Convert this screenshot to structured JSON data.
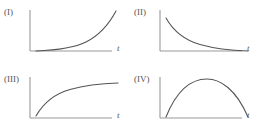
{
  "figure": {
    "title": "",
    "background_color": "#ffffff",
    "axis_color": "#999999",
    "curve_color": "#555555",
    "width": 261,
    "height": 134
  },
  "panels": [
    {
      "label": "(I)",
      "xlabel": "t",
      "ylabel": "",
      "curve_name": "exponential-growth-curve",
      "description": "exponential growth",
      "path": "M 6 43 C 26 42.2, 44 40, 56 34 C 68 28, 78 18, 86 3"
    },
    {
      "label": "(II)",
      "xlabel": "t",
      "ylabel": "",
      "curve_name": "exponential-decay-curve",
      "description": "exponential decay to positive asymptote",
      "path": "M 6 10 C 14 24, 24 32, 40 36.5 C 56 41, 72 42.5, 88 43"
    },
    {
      "label": "(III)",
      "xlabel": "t",
      "ylabel": "",
      "curve_name": "saturating-growth-curve",
      "description": "saturating growth to plateau",
      "path": "M 6 41 C 14 27, 24 19, 40 14.5 C 56 10, 72 8.5, 88 8"
    },
    {
      "label": "(IV)",
      "xlabel": "t",
      "ylabel": "",
      "curve_name": "inverted-parabola-curve",
      "description": "rise to maximum then fall",
      "path": "M 6 42 C 18 12, 34 4, 47 4 C 60 4, 76 14, 88 42"
    }
  ],
  "chart_data": {
    "type": "line",
    "title": "",
    "xlabel": "t",
    "ylabel": "",
    "grid": false,
    "legend": "none",
    "panel_layout": "2x2",
    "xlim": [
      0,
      1
    ],
    "ylim": [
      0,
      1
    ],
    "series": [
      {
        "name": "(I)",
        "shape": "exponential growth",
        "x": [
          0.0,
          0.2,
          0.4,
          0.6,
          0.8,
          1.0
        ],
        "values": [
          0.1,
          0.13,
          0.2,
          0.33,
          0.58,
          1.0
        ]
      },
      {
        "name": "(II)",
        "shape": "exponential decay to positive asymptote",
        "x": [
          0.0,
          0.2,
          0.4,
          0.6,
          0.8,
          1.0
        ],
        "values": [
          0.85,
          0.5,
          0.31,
          0.21,
          0.15,
          0.12
        ]
      },
      {
        "name": "(III)",
        "shape": "saturating growth to plateau",
        "x": [
          0.0,
          0.2,
          0.4,
          0.6,
          0.8,
          1.0
        ],
        "values": [
          0.1,
          0.5,
          0.7,
          0.8,
          0.85,
          0.88
        ]
      },
      {
        "name": "(IV)",
        "shape": "rise to maximum then fall",
        "x": [
          0.0,
          0.2,
          0.4,
          0.5,
          0.6,
          0.8,
          1.0
        ],
        "values": [
          0.05,
          0.72,
          0.93,
          0.95,
          0.93,
          0.72,
          0.05
        ]
      }
    ]
  }
}
